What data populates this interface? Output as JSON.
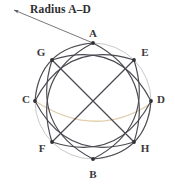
{
  "figure": {
    "background_color": "#ffffff",
    "caption": {
      "text": "Radius A–D",
      "color": "#2e2e2e"
    },
    "leader": {
      "name": "radius-leader-line",
      "color": "#55555a",
      "arrow_tip": [
        11,
        9
      ],
      "anchor": [
        93,
        43
      ]
    },
    "circle": {
      "name": "outer-circle",
      "center_x": 93,
      "center_y": 101,
      "radius": 58,
      "stroke_color": "#c9c9c9",
      "stroke_width": 1.0
    },
    "highlight_arc": {
      "name": "radius-highlight-arc",
      "color": "#e3cfae",
      "stroke_width": 1.4
    },
    "arc_style": {
      "stroke_color": "#4a4a52",
      "stroke_width": 1.15
    },
    "vertex_dot": {
      "color": "#2f2f35",
      "radius": 1.9
    },
    "vertices": [
      {
        "id": "A",
        "label": "A",
        "angle_deg": 90,
        "x": 93,
        "y": 43,
        "label_x": 86,
        "label_y": 28
      },
      {
        "id": "E",
        "label": "E",
        "angle_deg": 45,
        "x": 134,
        "y": 60,
        "label_x": 138,
        "label_y": 47
      },
      {
        "id": "D",
        "label": "D",
        "angle_deg": 0,
        "x": 151,
        "y": 101,
        "label_x": 154,
        "label_y": 94
      },
      {
        "id": "H",
        "label": "H",
        "angle_deg": 315,
        "x": 134,
        "y": 142,
        "label_x": 138,
        "label_y": 143
      },
      {
        "id": "B",
        "label": "B",
        "angle_deg": 270,
        "x": 93,
        "y": 159,
        "label_x": 86,
        "label_y": 169
      },
      {
        "id": "F",
        "label": "F",
        "angle_deg": 225,
        "x": 52,
        "y": 142,
        "label_x": 35,
        "label_y": 143
      },
      {
        "id": "C",
        "label": "C",
        "angle_deg": 180,
        "x": 35,
        "y": 101,
        "label_x": 19,
        "label_y": 94
      },
      {
        "id": "G",
        "label": "G",
        "angle_deg": 135,
        "x": 52,
        "y": 60,
        "label_x": 34,
        "label_y": 47
      }
    ],
    "arcs": [
      {
        "name": "arc-A-F",
        "from": "A",
        "to": "F"
      },
      {
        "name": "arc-F-E",
        "from": "F",
        "to": "E"
      },
      {
        "name": "arc-E-B",
        "from": "E",
        "to": "B"
      },
      {
        "name": "arc-B-G",
        "from": "B",
        "to": "G"
      },
      {
        "name": "arc-G-H",
        "from": "G",
        "to": "H"
      },
      {
        "name": "arc-H-C",
        "from": "H",
        "to": "C"
      },
      {
        "name": "arc-C-E",
        "from": "C",
        "to": "E"
      },
      {
        "name": "arc-D-F",
        "from": "D",
        "to": "F"
      },
      {
        "name": "arc-D-G",
        "from": "D",
        "to": "G"
      },
      {
        "name": "arc-A-H",
        "from": "A",
        "to": "H"
      },
      {
        "name": "arc-C-A",
        "from": "C",
        "to": "A"
      },
      {
        "name": "arc-B-D",
        "from": "B",
        "to": "D"
      }
    ]
  }
}
